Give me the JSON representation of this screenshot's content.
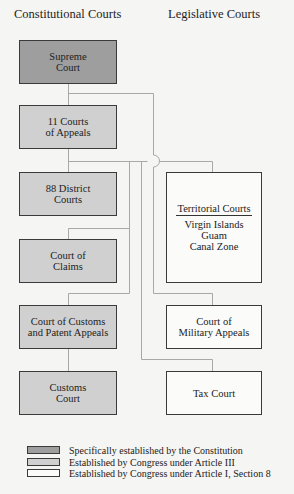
{
  "headings": {
    "left": "Constitutional Courts",
    "right": "Legislative Courts"
  },
  "colors": {
    "constitution": "#9e9e9e",
    "article_iii": "#d0d0d0",
    "article_i": "#fbfbfa",
    "line": "#a8a8a8"
  },
  "constitutional_courts": [
    {
      "id": "supreme",
      "lines": [
        "Supreme",
        "Court"
      ],
      "category": "constitution"
    },
    {
      "id": "appeals",
      "lines": [
        "11 Courts",
        "of Appeals"
      ],
      "category": "article_iii"
    },
    {
      "id": "district",
      "lines": [
        "88 District",
        "Courts"
      ],
      "category": "article_iii"
    },
    {
      "id": "claims",
      "lines": [
        "Court of",
        "Claims"
      ],
      "category": "article_iii"
    },
    {
      "id": "customs-patent",
      "lines": [
        "Court of Customs",
        "and Patent Appeals"
      ],
      "category": "article_iii"
    },
    {
      "id": "customs",
      "lines": [
        "Customs",
        "Court"
      ],
      "category": "article_iii"
    }
  ],
  "legislative_courts": [
    {
      "id": "territorial",
      "title": "Territorial Courts",
      "lines": [
        "Virgin Islands",
        "Guam",
        "Canal Zone"
      ],
      "category": "article_i"
    },
    {
      "id": "military",
      "lines": [
        "Court of",
        "Military Appeals"
      ],
      "category": "article_i"
    },
    {
      "id": "tax",
      "lines": [
        "Tax Court"
      ],
      "category": "article_i"
    }
  ],
  "legend": [
    {
      "category": "constitution",
      "label": "Specifically established by the Constitution"
    },
    {
      "category": "article_iii",
      "label": "Established by Congress under Article III"
    },
    {
      "category": "article_i",
      "label": "Established by Congress under Article I, Section 8"
    }
  ]
}
